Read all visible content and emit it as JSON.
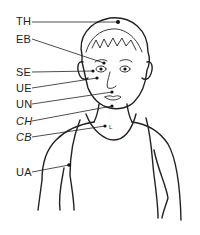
{
  "diagram": {
    "labels": [
      {
        "id": "TH",
        "text": "TH",
        "x": 16,
        "y": 16
      },
      {
        "id": "EB",
        "text": "EB",
        "x": 16,
        "y": 34
      },
      {
        "id": "SE",
        "text": "SE",
        "x": 16,
        "y": 67
      },
      {
        "id": "UE",
        "text": "UE",
        "x": 16,
        "y": 83
      },
      {
        "id": "UN",
        "text": "UN",
        "x": 16,
        "y": 99
      },
      {
        "id": "CH",
        "text": "CH",
        "x": 16,
        "y": 116
      },
      {
        "id": "CB",
        "text": "CB",
        "x": 16,
        "y": 132
      },
      {
        "id": "UA",
        "text": "UA",
        "x": 16,
        "y": 167
      }
    ],
    "small_mark": "L",
    "colors": {
      "ink": "#222222",
      "background": "#ffffff"
    }
  }
}
